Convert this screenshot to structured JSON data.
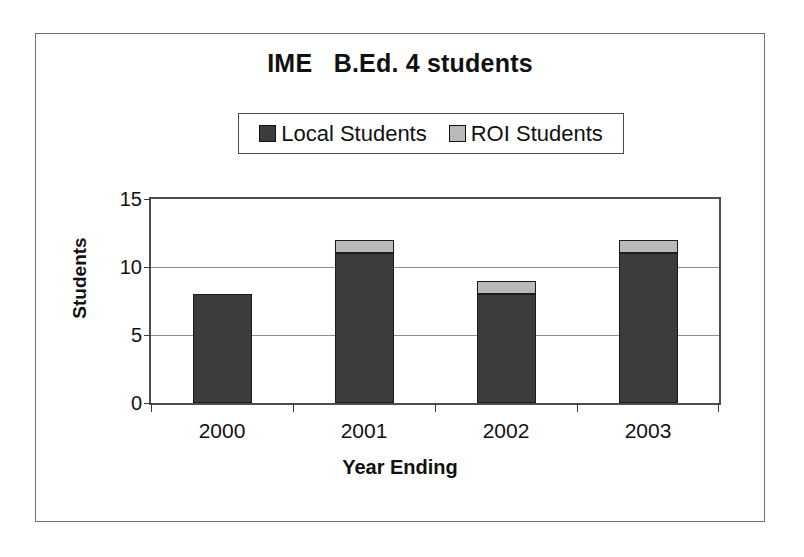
{
  "chart_data": {
    "type": "bar",
    "subtype": "stacked",
    "title": "IME   B.Ed. 4 students",
    "xlabel": "Year Ending",
    "ylabel": "Students",
    "categories": [
      "2000",
      "2001",
      "2002",
      "2003"
    ],
    "series": [
      {
        "name": "Local Students",
        "values": [
          8,
          11,
          8,
          11
        ],
        "color": "#3c3c3c"
      },
      {
        "name": "ROI Students",
        "values": [
          0,
          1,
          1,
          1
        ],
        "color": "#b9b9b9"
      }
    ],
    "totals": [
      8,
      12,
      9,
      12
    ],
    "ylim": [
      0,
      15
    ],
    "yticks": [
      0,
      5,
      10,
      15
    ],
    "ytick_labels": [
      "0",
      "5",
      "10",
      "15"
    ],
    "grid": true,
    "grid_axis": "y",
    "legend_position": "top-center",
    "legend_entries": [
      "Local Students",
      "ROI Students"
    ]
  }
}
